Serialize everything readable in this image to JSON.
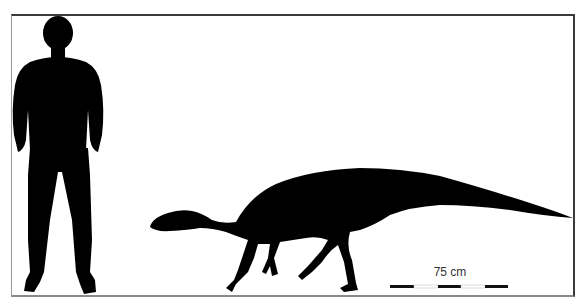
{
  "figure": {
    "type": "size-comparison",
    "subjects": [
      {
        "name": "human-silhouette",
        "color": "#000000"
      },
      {
        "name": "dinosaur-silhouette",
        "color": "#000000"
      }
    ],
    "scale_bar": {
      "label": "75 cm",
      "segments": [
        "black",
        "white",
        "black",
        "white",
        "black"
      ],
      "colors": {
        "black": "#111111",
        "white": "#ffffff"
      }
    },
    "frame_color": "#3a3a3a",
    "background": "#ffffff"
  }
}
